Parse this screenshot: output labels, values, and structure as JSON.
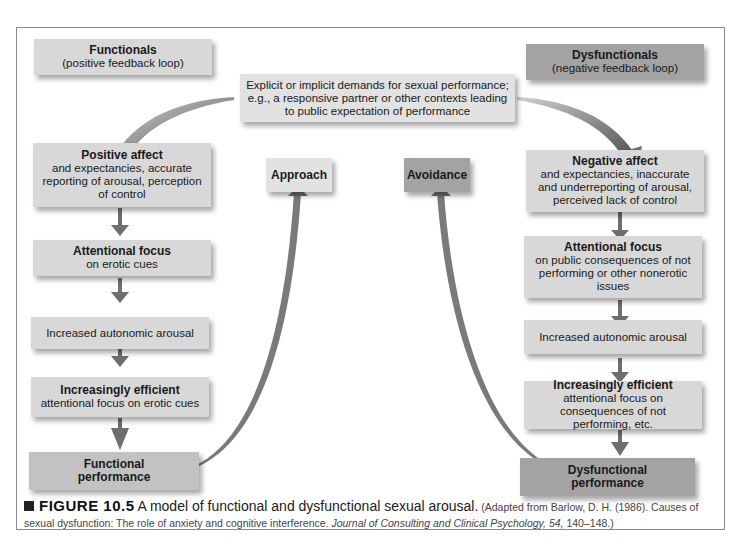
{
  "header": {
    "functionals": {
      "title": "Functionals",
      "subtitle": "(positive feedback loop)"
    },
    "dysfunctionals": {
      "title": "Dysfunctionals",
      "subtitle": "(negative feedback loop)"
    }
  },
  "top_box": {
    "line1": "Explicit or implicit demands for sexual performance;",
    "line2": "e.g., a responsive partner or other contexts leading",
    "line3": "to public expectation of performance"
  },
  "middle": {
    "approach": "Approach",
    "avoidance": "Avoidance"
  },
  "left_chain": [
    {
      "title": "Positive affect",
      "text": "and expectancies, accurate reporting of arousal, perception of control"
    },
    {
      "title": "Attentional focus",
      "text": "on erotic cues"
    },
    {
      "title": "",
      "text": "Increased autonomic arousal"
    },
    {
      "title": "Increasingly efficient",
      "text": "attentional focus on erotic cues"
    },
    {
      "title": "Functional performance",
      "text": ""
    }
  ],
  "right_chain": [
    {
      "title": "Negative affect",
      "text": "and expectancies, inaccurate and underreporting of arousal, perceived lack of control"
    },
    {
      "title": "Attentional focus",
      "text": "on public consequences of not performing or other nonerotic issues"
    },
    {
      "title": "",
      "text": "Increased autonomic arousal"
    },
    {
      "title": "Increasingly efficient",
      "text": "attentional focus on consequences of not performing, etc."
    },
    {
      "title": "Dysfunctional performance",
      "text": ""
    }
  ],
  "caption": {
    "label": "FIGURE 10.5",
    "title": "A model of functional and dysfunctional sexual arousal.",
    "source_pre": "(Adapted from Barlow, D. H. (1986). Causes of sexual dysfunction: The role of anxiety and cognitive interference. ",
    "journal": "Journal of Consulting and Clinical Psychology, 54,",
    "source_post": " 140–148.)"
  },
  "colors": {
    "box_light": "#d8d8d8",
    "box_mid": "#c2c2c2",
    "box_dark": "#a3a3a3",
    "arrow": "#6e6e6e"
  }
}
